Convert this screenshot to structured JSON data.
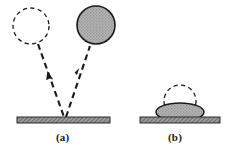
{
  "figure": {
    "title": "",
    "caption": "",
    "background_color": "#ffffff",
    "ink_color": "#1a1a1a",
    "droplet_fill_color": "#a8a8a8",
    "substrate_fill_color": "#8f8f8f",
    "substrate_edge_color": "#2b2b2b"
  },
  "panels": [
    {
      "id": "a",
      "label": "(a)",
      "description": "rebounding droplet",
      "elements": {
        "incoming_droplet": {
          "name": "dashed-outline-circle",
          "style": "dashed",
          "filled": false,
          "center_x": 31,
          "center_y": 26,
          "radius": 18
        },
        "outgoing_droplet": {
          "name": "filled-gray-circle",
          "style": "solid",
          "filled": true,
          "center_x": 96,
          "center_y": 25,
          "radius": 19
        },
        "incoming_arrow": {
          "name": "incoming-dashed-arrow",
          "direction": "down-right",
          "from_x": 38,
          "from_y": 44,
          "to_x": 64,
          "to_y": 118
        },
        "outgoing_arrow": {
          "name": "outgoing-dashed-arrow",
          "direction": "up-right",
          "from_x": 66,
          "from_y": 118,
          "to_x": 90,
          "to_y": 45
        },
        "substrate": {
          "name": "hatched-substrate-bar",
          "x": 17,
          "y": 117,
          "width": 93,
          "height": 6
        }
      }
    },
    {
      "id": "b",
      "label": "(b)",
      "description": "spread / splatted droplet",
      "elements": {
        "original_droplet_outline": {
          "name": "dashed-outline-circle",
          "style": "dashed",
          "filled": false,
          "center_x": 180,
          "center_y": 101,
          "radius": 16
        },
        "splat": {
          "name": "filled-gray-ellipse-splat",
          "style": "solid",
          "filled": true,
          "center_x": 180,
          "center_y": 112,
          "radius_x": 24,
          "radius_y": 9
        },
        "substrate": {
          "name": "hatched-substrate-bar",
          "x": 140,
          "y": 117,
          "width": 80,
          "height": 6
        }
      }
    }
  ]
}
